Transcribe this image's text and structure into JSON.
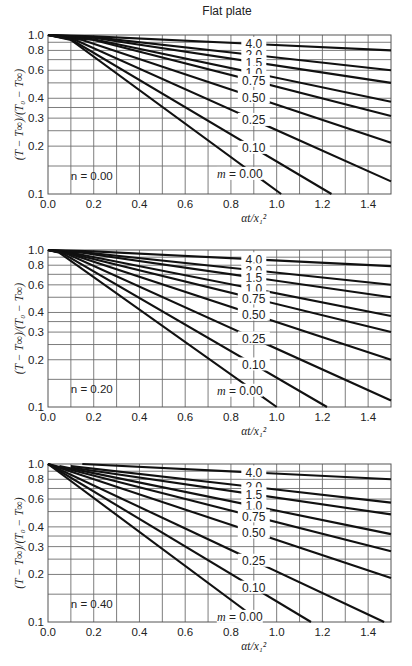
{
  "figure": {
    "title": "Flat plate"
  },
  "chart_data": [
    {
      "type": "line",
      "title": "Flat plate",
      "panel_label": "n = 0.00",
      "xlabel": "αt/x₁²",
      "ylabel": "(T − T∞)/(T₀ − T∞)",
      "xlim": [
        0.0,
        1.5
      ],
      "ylim": [
        0.1,
        1.0
      ],
      "yscale": "log",
      "grid": true,
      "xticks": [
        "0.0",
        "0.2",
        "0.4",
        "0.6",
        "0.8",
        "1.0",
        "1.2",
        "1.4"
      ],
      "yticks": [
        "1.0",
        "0.8",
        "0.6",
        "0.4",
        "0.3",
        "0.2",
        "0.1"
      ],
      "series": [
        {
          "name": "4.0",
          "x": [
            0.0,
            0.2,
            1.5
          ],
          "y": [
            1.0,
            0.98,
            0.8
          ]
        },
        {
          "name": "2.0",
          "x": [
            0.0,
            0.2,
            1.5
          ],
          "y": [
            1.0,
            0.97,
            0.6
          ]
        },
        {
          "name": "1.5",
          "x": [
            0.0,
            0.2,
            1.5
          ],
          "y": [
            1.0,
            0.96,
            0.5
          ]
        },
        {
          "name": "1.0",
          "x": [
            0.0,
            0.2,
            1.5
          ],
          "y": [
            1.0,
            0.94,
            0.38
          ]
        },
        {
          "name": "0.75",
          "x": [
            0.0,
            0.2,
            1.5
          ],
          "y": [
            1.0,
            0.93,
            0.31
          ]
        },
        {
          "name": "0.50",
          "x": [
            0.0,
            0.15,
            1.5
          ],
          "y": [
            1.0,
            0.93,
            0.21
          ]
        },
        {
          "name": "0.25",
          "x": [
            0.0,
            0.12,
            1.5
          ],
          "y": [
            1.0,
            0.93,
            0.12
          ]
        },
        {
          "name": "0.10",
          "x": [
            0.0,
            0.1,
            1.24
          ],
          "y": [
            1.0,
            0.94,
            0.1
          ]
        },
        {
          "name": "m = 0.00",
          "x": [
            0.0,
            0.1,
            1.02
          ],
          "y": [
            1.0,
            0.93,
            0.1
          ]
        }
      ],
      "curve_label_x": 0.9
    },
    {
      "type": "line",
      "title": "",
      "panel_label": "n = 0.20",
      "xlabel": "αt/x₁²",
      "ylabel": "(T − T∞)/(T₀ − T∞)",
      "xlim": [
        0.0,
        1.5
      ],
      "ylim": [
        0.1,
        1.0
      ],
      "yscale": "log",
      "grid": true,
      "xticks": [
        "0.0",
        "0.2",
        "0.4",
        "0.6",
        "0.8",
        "1.0",
        "1.2",
        "1.4"
      ],
      "yticks": [
        "1.0",
        "0.8",
        "0.6",
        "0.4",
        "0.3",
        "0.2",
        "0.1"
      ],
      "series": [
        {
          "name": "4.0",
          "x": [
            0.0,
            0.2,
            1.5
          ],
          "y": [
            1.0,
            0.98,
            0.79
          ]
        },
        {
          "name": "2.0",
          "x": [
            0.0,
            0.15,
            1.5
          ],
          "y": [
            1.0,
            0.97,
            0.6
          ]
        },
        {
          "name": "1.5",
          "x": [
            0.0,
            0.15,
            1.5
          ],
          "y": [
            1.0,
            0.96,
            0.5
          ]
        },
        {
          "name": "1.0",
          "x": [
            0.0,
            0.12,
            1.5
          ],
          "y": [
            1.0,
            0.95,
            0.38
          ]
        },
        {
          "name": "0.75",
          "x": [
            0.0,
            0.1,
            1.5
          ],
          "y": [
            1.0,
            0.95,
            0.3
          ]
        },
        {
          "name": "0.50",
          "x": [
            0.0,
            0.1,
            1.5
          ],
          "y": [
            1.0,
            0.94,
            0.2
          ]
        },
        {
          "name": "0.25",
          "x": [
            0.0,
            0.08,
            1.5
          ],
          "y": [
            1.0,
            0.95,
            0.11
          ]
        },
        {
          "name": "0.10",
          "x": [
            0.0,
            0.06,
            1.22
          ],
          "y": [
            1.0,
            0.96,
            0.1
          ]
        },
        {
          "name": "m = 0.00",
          "x": [
            0.0,
            0.05,
            1.0
          ],
          "y": [
            1.0,
            0.96,
            0.1
          ]
        }
      ],
      "curve_label_x": 0.9
    },
    {
      "type": "line",
      "title": "",
      "panel_label": "n = 0.40",
      "xlabel": "αt/x₁²",
      "ylabel": "(T − T∞)/(T₀ − T∞)",
      "xlim": [
        0.0,
        1.5
      ],
      "ylim": [
        0.1,
        1.0
      ],
      "yscale": "log",
      "grid": true,
      "xticks": [
        "0.0",
        "0.2",
        "0.4",
        "0.6",
        "0.8",
        "1.0",
        "1.2",
        "1.4"
      ],
      "yticks": [
        "1.0",
        "0.8",
        "0.6",
        "0.4",
        "0.3",
        "0.2",
        "0.1"
      ],
      "series": [
        {
          "name": "4.0",
          "x": [
            0.15,
            1.5
          ],
          "y": [
            1.0,
            0.8
          ]
        },
        {
          "name": "2.0",
          "x": [
            0.1,
            1.5
          ],
          "y": [
            0.97,
            0.57
          ]
        },
        {
          "name": "1.5",
          "x": [
            0.1,
            1.5
          ],
          "y": [
            0.95,
            0.48
          ]
        },
        {
          "name": "1.0",
          "x": [
            0.05,
            1.5
          ],
          "y": [
            0.97,
            0.36
          ]
        },
        {
          "name": "0.75",
          "x": [
            0.0,
            1.5
          ],
          "y": [
            1.0,
            0.28
          ]
        },
        {
          "name": "0.50",
          "x": [
            0.0,
            1.5
          ],
          "y": [
            1.0,
            0.19
          ]
        },
        {
          "name": "0.25",
          "x": [
            0.0,
            1.47
          ],
          "y": [
            1.0,
            0.1
          ]
        },
        {
          "name": "0.10",
          "x": [
            0.0,
            1.15
          ],
          "y": [
            1.0,
            0.1
          ]
        },
        {
          "name": "m = 0.00",
          "x": [
            0.0,
            0.93
          ],
          "y": [
            1.0,
            0.1
          ]
        }
      ],
      "curve_label_x": 0.9
    }
  ]
}
